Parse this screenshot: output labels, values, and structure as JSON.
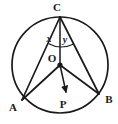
{
  "figure": {
    "type": "circle-geometry-diagram",
    "background_color": "#ffffff",
    "stroke_color": "#1a1a1a",
    "circle": {
      "name": "main-circle",
      "center_label": "O",
      "center_x": 60,
      "center_y": 65,
      "radius": 48,
      "stroke_width": 1.6
    },
    "points": [
      {
        "label": "C",
        "x": 60,
        "y": 17,
        "label_x": 57,
        "label_y": 11,
        "marked": false
      },
      {
        "label": "O",
        "x": 60,
        "y": 65,
        "label_x": 52,
        "label_y": 62,
        "marked": true
      },
      {
        "label": "A",
        "x": 22,
        "y": 100,
        "label_x": 12,
        "label_y": 110,
        "marked": false
      },
      {
        "label": "B",
        "x": 99,
        "y": 94,
        "label_x": 104,
        "label_y": 102,
        "marked": false
      },
      {
        "label": "P",
        "x": 66,
        "y": 93,
        "label_x": 61,
        "label_y": 106,
        "marked": false
      }
    ],
    "segments": [
      {
        "name": "segment-CA",
        "from": "C",
        "to": "A"
      },
      {
        "name": "segment-CB",
        "from": "C",
        "to": "B"
      },
      {
        "name": "segment-CO",
        "from": "C",
        "to": "O"
      },
      {
        "name": "segment-OA",
        "from": "O",
        "to": "A"
      },
      {
        "name": "segment-OB",
        "from": "O",
        "to": "B"
      }
    ],
    "rays": [
      {
        "name": "ray-OP",
        "from": "O",
        "to": "P",
        "arrowhead": true
      }
    ],
    "angles": [
      {
        "name": "angle-x",
        "label": "x",
        "vertex": "C",
        "between": "CA and CO",
        "label_x": 46,
        "label_y": 41
      },
      {
        "name": "angle-y",
        "label": "y",
        "vertex": "C",
        "between": "CO and CB",
        "label_x": 62,
        "label_y": 42
      }
    ],
    "arcs": [
      {
        "name": "angle-arc-at-C",
        "vertex": "C",
        "radius": 27,
        "spans": "from CA to CB"
      }
    ]
  }
}
